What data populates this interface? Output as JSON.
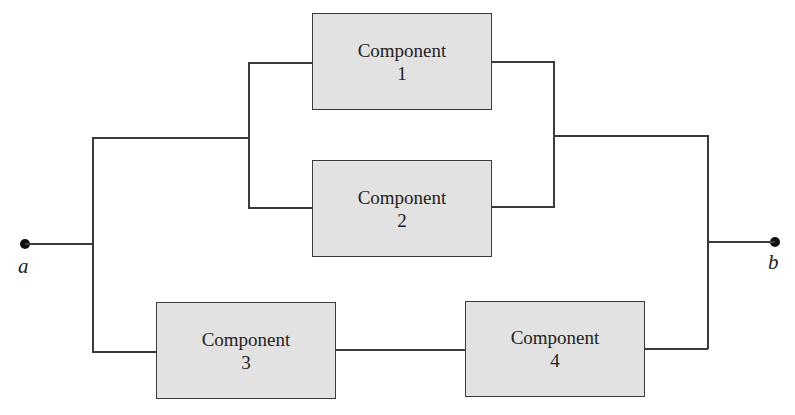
{
  "diagram": {
    "type": "reliability-block-diagram",
    "nodes": {
      "start": {
        "label": "a"
      },
      "end": {
        "label": "b"
      }
    },
    "components": [
      {
        "id": 1,
        "name": "Component",
        "number": "1"
      },
      {
        "id": 2,
        "name": "Component",
        "number": "2"
      },
      {
        "id": 3,
        "name": "Component",
        "number": "3"
      },
      {
        "id": 4,
        "name": "Component",
        "number": "4"
      }
    ],
    "structure": {
      "upper_branch": "Component 1 parallel Component 2",
      "lower_branch": "Component 3 series Component 4",
      "overall": "upper_branch parallel lower_branch, between a and b"
    },
    "colors": {
      "box_fill": "#e2e2e2",
      "line": "#3a3a3a",
      "node": "#111111"
    }
  }
}
